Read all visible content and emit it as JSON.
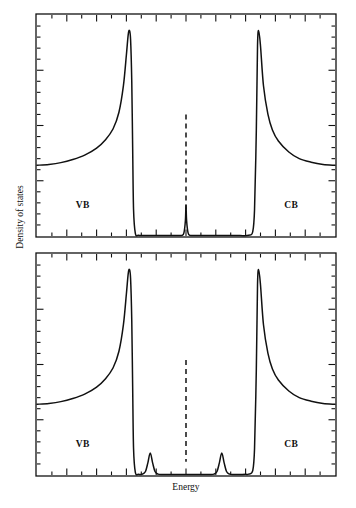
{
  "figure": {
    "xlabel": "Energy",
    "ylabel": "Density of states"
  },
  "labels": {
    "vb": "VB",
    "cb": "CB"
  },
  "style": {
    "curve_color": "#111111",
    "axis_color": "#111111",
    "fermi_color": "#111111",
    "background": "#ffffff"
  },
  "chart_data": [
    {
      "type": "line",
      "title": "",
      "panel": "top",
      "xlabel": "",
      "ylabel": "Density of states",
      "xlim": [
        0,
        100
      ],
      "ylim": [
        0,
        100
      ],
      "grid": false,
      "legend": "none",
      "annotations": [
        {
          "text": "VB",
          "x": 16,
          "y": 13
        },
        {
          "text": "CB",
          "x": 86,
          "y": 13
        }
      ],
      "fermi_level": {
        "x": 50,
        "style": "dashed",
        "y_from": 6,
        "y_to": 55
      },
      "features": {
        "vb_edge_singularity_x": 31,
        "vb_edge_singularity_y": 93,
        "cb_edge_singularity_x": 74,
        "cb_edge_singularity_y": 93,
        "band_tail_plateau_y": 32,
        "midgap_peaks": [
          {
            "x": 50,
            "height": 14,
            "width": 1.6
          }
        ],
        "gap_floor_y": 0
      },
      "series": [
        {
          "name": "Density of states (single midgap level)",
          "x": [
            0,
            4,
            8,
            12,
            16,
            20,
            23,
            25.5,
            27.5,
            29,
            30,
            30.6,
            31,
            31.4,
            31.8,
            32.1,
            32.4,
            33,
            34,
            36,
            40,
            44,
            47,
            48.6,
            49.3,
            49.8,
            50,
            50.2,
            50.7,
            51.4,
            53,
            56,
            60,
            64,
            68,
            71,
            72.4,
            73,
            73.6,
            74,
            74.4,
            75,
            76,
            77.5,
            79,
            81,
            84.5,
            88,
            92,
            96,
            100
          ],
          "y": [
            32,
            32.4,
            33.2,
            34.6,
            36.6,
            39.8,
            43.6,
            48.4,
            56,
            68,
            82,
            91,
            93,
            89,
            70,
            40,
            12,
            1.2,
            0.3,
            0.2,
            0.2,
            0.2,
            0.2,
            0.3,
            1.4,
            7,
            14,
            7,
            1.4,
            0.3,
            0.2,
            0.2,
            0.2,
            0.2,
            0.2,
            0.3,
            2,
            12,
            48,
            86,
            93,
            86,
            68,
            55,
            48,
            43,
            38,
            35,
            33.4,
            32.4,
            32
          ]
        }
      ]
    },
    {
      "type": "line",
      "title": "",
      "panel": "bottom",
      "xlabel": "Energy",
      "ylabel": "Density of states",
      "xlim": [
        0,
        100
      ],
      "ylim": [
        0,
        100
      ],
      "grid": false,
      "legend": "none",
      "annotations": [
        {
          "text": "VB",
          "x": 16,
          "y": 13
        },
        {
          "text": "CB",
          "x": 86,
          "y": 13
        }
      ],
      "fermi_level": {
        "x": 50,
        "style": "dashed",
        "y_from": 6,
        "y_to": 52
      },
      "features": {
        "vb_edge_singularity_x": 31,
        "vb_edge_singularity_y": 93,
        "cb_edge_singularity_x": 74,
        "cb_edge_singularity_y": 93,
        "band_tail_plateau_y": 32,
        "midgap_peaks": [
          {
            "x": 38,
            "height": 10,
            "width": 4
          },
          {
            "x": 62,
            "height": 10,
            "width": 4
          }
        ],
        "gap_floor_y": 0
      },
      "series": [
        {
          "name": "Density of states (split midgap levels)",
          "x": [
            0,
            4,
            8,
            12,
            16,
            20,
            23,
            25.5,
            27.5,
            29,
            30,
            30.6,
            31,
            31.4,
            31.8,
            32.1,
            32.4,
            33,
            34,
            35.4,
            36.4,
            37.2,
            38,
            38.8,
            39.6,
            40.6,
            42,
            44,
            47,
            50,
            53,
            56,
            58,
            59.4,
            60.4,
            61.2,
            62,
            62.8,
            63.6,
            64.6,
            66,
            68,
            70,
            71,
            72.4,
            73,
            73.6,
            74,
            74.4,
            75,
            76,
            77.5,
            79,
            81,
            84.5,
            88,
            92,
            96,
            100
          ],
          "y": [
            32,
            32.4,
            33.2,
            34.6,
            36.6,
            39.8,
            43.6,
            48.4,
            56,
            68,
            82,
            91,
            93,
            89,
            70,
            40,
            12,
            1.2,
            0.3,
            0.4,
            1.6,
            5.5,
            10,
            5.5,
            1.6,
            0.4,
            0.2,
            0.2,
            0.2,
            0.2,
            0.2,
            0.2,
            0.2,
            0.4,
            1.6,
            5.5,
            10,
            5.5,
            1.6,
            0.4,
            0.2,
            0.2,
            0.3,
            0.4,
            2,
            12,
            48,
            86,
            93,
            86,
            68,
            55,
            48,
            43,
            38,
            35,
            33.4,
            32.4,
            32
          ]
        }
      ]
    }
  ]
}
